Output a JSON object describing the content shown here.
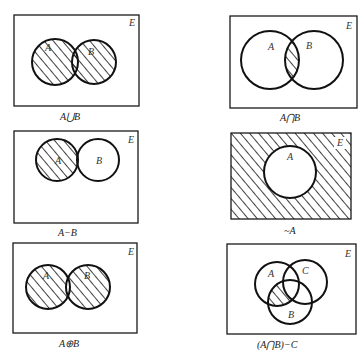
{
  "figure": {
    "universe_label": "E",
    "panels": [
      {
        "id": "union",
        "caption": "A ∪ B",
        "sets": [
          "A",
          "B"
        ],
        "shaded": "A or B"
      },
      {
        "id": "intersection",
        "caption": "A ∩ B",
        "sets": [
          "A",
          "B"
        ],
        "shaded": "A and B"
      },
      {
        "id": "difference",
        "caption": "A − B",
        "sets": [
          "A",
          "B"
        ],
        "shaded": "A and not B"
      },
      {
        "id": "complement",
        "caption": "~A",
        "sets": [
          "A"
        ],
        "shaded": "not A"
      },
      {
        "id": "symmetric-difference",
        "caption": "A ⊕ B",
        "sets": [
          "A",
          "B"
        ],
        "shaded": "A xor B"
      },
      {
        "id": "intersection-minus-c",
        "caption": "(A ∩ B)−C",
        "sets": [
          "A",
          "B",
          "C"
        ],
        "shaded": "A and B and not C"
      }
    ],
    "labels": {
      "A": "A",
      "B": "B",
      "C": "C",
      "E": "E"
    },
    "captions": {
      "union": "A⋃B",
      "intersection": "A⋂B",
      "difference": "A−B",
      "complement": "~A",
      "symdiff": "A⊕B",
      "abc": "(A⋂B)−C"
    }
  }
}
